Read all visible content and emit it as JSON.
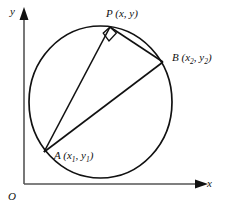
{
  "figure": {
    "background_color": "#ffffff",
    "stroke_color": "#111111",
    "width": 225,
    "height": 211
  },
  "axes": {
    "x_label": "x",
    "y_label": "y",
    "origin_label": "O",
    "x_axis_y": 184,
    "y_axis_x": 24,
    "x_axis_start": 24,
    "x_axis_end": 205,
    "y_axis_top": 12,
    "y_axis_bottom": 184,
    "arrowheads": [
      "x-axis-arrow",
      "y-axis-arrow"
    ]
  },
  "circle": {
    "center_x": 100.5,
    "center_y": 102,
    "radius_x": 71.5,
    "radius_y": 76,
    "stroke_width": 1.6
  },
  "points": [
    {
      "id": "P",
      "name": "P",
      "coords_text": "(x, y)",
      "label": "P (x, y)",
      "x": 110,
      "y": 27
    },
    {
      "id": "B",
      "name": "B",
      "coords_text": "(x2, y2)",
      "label": "B (x₂, y₂)",
      "x": 163,
      "y": 62
    },
    {
      "id": "A",
      "name": "A",
      "coords_text": "(x1, y1)",
      "label": "A (x₁, y₁)",
      "x": 44,
      "y": 152
    }
  ],
  "segments": [
    {
      "name": "segment-PA",
      "from": "P",
      "to": "A"
    },
    {
      "name": "segment-PB",
      "from": "P",
      "to": "B"
    },
    {
      "name": "segment-AB",
      "from": "A",
      "to": "B"
    }
  ],
  "right_angle_marker": {
    "name": "right-angle-marker-at-P",
    "vertex": "P",
    "size": 9
  },
  "labels": {
    "P_main": "P",
    "P_coords": " (x, y)",
    "B_main": "B",
    "B_open": " (x",
    "B_sub1": "2",
    "B_mid": ", y",
    "B_sub2": "2",
    "B_close": ")",
    "A_main": "A",
    "A_open": " (x",
    "A_sub1": "1",
    "A_mid": ", y",
    "A_sub2": "1",
    "A_close": ")"
  }
}
